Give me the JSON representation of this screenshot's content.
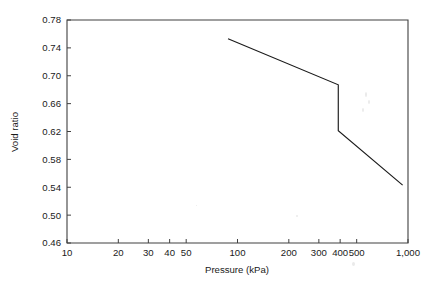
{
  "chart_data": {
    "type": "line",
    "title": "",
    "xlabel": "Pressure (kPa)",
    "ylabel": "Void ratio",
    "xscale": "log",
    "yscale": "linear",
    "xlim": [
      10,
      1000
    ],
    "ylim": [
      0.46,
      0.78
    ],
    "grid": false,
    "legend": null,
    "xticks": [
      10,
      20,
      30,
      40,
      50,
      100,
      200,
      300,
      400,
      500,
      1000
    ],
    "xtick_labels": [
      "10",
      "20",
      "30",
      "40",
      "50",
      "100",
      "200",
      "300",
      "400",
      "500",
      "1,000"
    ],
    "yticks": [
      0.46,
      0.5,
      0.54,
      0.58,
      0.62,
      0.66,
      0.7,
      0.74,
      0.78
    ],
    "ytick_labels": [
      "0.46",
      "0.50",
      "0.54",
      "0.58",
      "0.62",
      "0.66",
      "0.70",
      "0.74",
      "0.78"
    ],
    "series": [
      {
        "name": "consolidation curve",
        "x": [
          88,
          390,
          390,
          930
        ],
        "y": [
          0.753,
          0.687,
          0.621,
          0.543
        ]
      }
    ]
  },
  "figure": {
    "axis_color": "#404040",
    "curve_color": "#1a1a1a",
    "background": "#ffffff"
  }
}
